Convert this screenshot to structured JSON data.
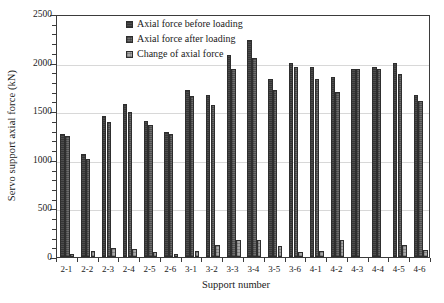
{
  "chart_data": {
    "type": "bar",
    "title": "",
    "xlabel": "Support number",
    "ylabel": "Servo support axial force (kN)",
    "ylim": [
      0,
      2500
    ],
    "ytick_step": 500,
    "yticks": [
      0,
      500,
      1000,
      1500,
      2000,
      2500
    ],
    "ytick_labels": [
      "0",
      "500",
      "1000",
      "1500",
      "2000",
      "2500"
    ],
    "grid": true,
    "grid_axis": "y",
    "legend_position": "upper-left-inside",
    "categories": [
      "2-1",
      "2-2",
      "2-3",
      "2-4",
      "2-5",
      "2-6",
      "3-1",
      "3-2",
      "3-3",
      "3-4",
      "3-5",
      "3-6",
      "4-1",
      "4-2",
      "4-3",
      "4-4",
      "4-5",
      "4-6"
    ],
    "series": [
      {
        "name": "Axial force before loading",
        "color": "#4d4d4d",
        "values": [
          1270,
          1060,
          1450,
          1570,
          1400,
          1290,
          1720,
          1670,
          2080,
          2230,
          1830,
          2000,
          1950,
          1850,
          1930,
          1950,
          2000,
          1670
        ]
      },
      {
        "name": "Axial force after loading",
        "color": "#6e6e6e",
        "values": [
          1240,
          1010,
          1390,
          1490,
          1360,
          1270,
          1660,
          1560,
          1930,
          2050,
          1720,
          1960,
          1830,
          1700,
          1930,
          1930,
          1880,
          1600
        ]
      },
      {
        "name": "Change of axial force",
        "color": "#a9a9a9",
        "values": [
          30,
          65,
          90,
          80,
          55,
          30,
          60,
          120,
          180,
          170,
          115,
          50,
          60,
          170,
          0,
          0,
          120,
          70
        ]
      }
    ]
  },
  "legend": {
    "items": [
      {
        "label": "Axial force before loading"
      },
      {
        "label": "Axial force after loading"
      },
      {
        "label": "Change of axial force"
      }
    ]
  }
}
